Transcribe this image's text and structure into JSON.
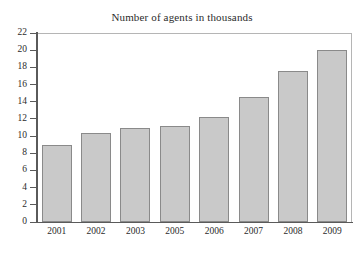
{
  "chart_data": {
    "type": "bar",
    "title": "Number of agents in thousands",
    "xlabel": "",
    "ylabel": "",
    "categories": [
      "2001",
      "2002",
      "2003",
      "2005",
      "2006",
      "2007",
      "2008",
      "2009"
    ],
    "values": [
      9.0,
      10.4,
      11.0,
      11.2,
      12.2,
      14.6,
      17.6,
      20.0
    ],
    "ylim": [
      0,
      22
    ],
    "ytick_step": 2,
    "ytick_labels": [
      "0",
      "2",
      "4",
      "6",
      "8",
      "10",
      "12",
      "14",
      "16",
      "18",
      "20",
      "22"
    ],
    "grid": false,
    "legend": false,
    "legend_position": "none",
    "colors": {
      "bar_fill": "#c9c9c9",
      "bar_edge": "#8a8a8a",
      "axis": "#5a5a5a",
      "frame": "#b5b5b5",
      "text": "#2b2b2b",
      "background": "#ffffff"
    }
  }
}
